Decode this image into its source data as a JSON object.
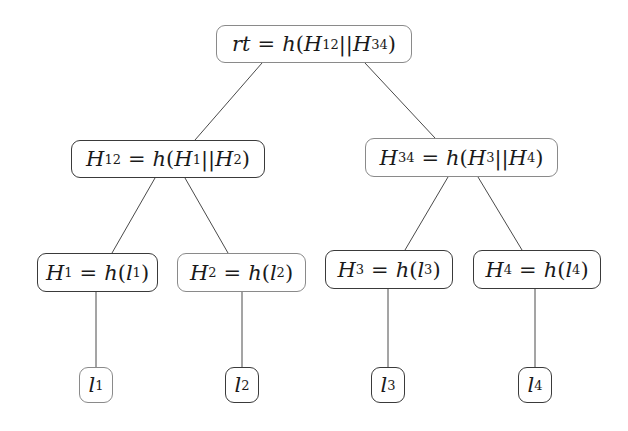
{
  "diagram": {
    "type": "merkle-tree",
    "nodes": [
      {
        "id": "root",
        "label": "rt = h(H12||H34)",
        "var": "rt",
        "fn": "h",
        "args": [
          "H12",
          "H34"
        ],
        "sep": "||"
      },
      {
        "id": "H12",
        "label": "H12 = h(H1||H2)",
        "var": "H",
        "var_sub": "12",
        "fn": "h",
        "args": [
          "H1",
          "H2"
        ],
        "sep": "||"
      },
      {
        "id": "H34",
        "label": "H34 = h(H3||H4)",
        "var": "H",
        "var_sub": "34",
        "fn": "h",
        "args": [
          "H3",
          "H4"
        ],
        "sep": "||"
      },
      {
        "id": "H1",
        "label": "H1 = h(l1)",
        "var": "H",
        "var_sub": "1",
        "fn": "h",
        "arg": "l",
        "arg_sub": "1"
      },
      {
        "id": "H2",
        "label": "H2 = h(l2)",
        "var": "H",
        "var_sub": "2",
        "fn": "h",
        "arg": "l",
        "arg_sub": "2"
      },
      {
        "id": "H3",
        "label": "H3 = h(l3)",
        "var": "H",
        "var_sub": "3",
        "fn": "h",
        "arg": "l",
        "arg_sub": "3"
      },
      {
        "id": "H4",
        "label": "H4 = h(l4)",
        "var": "H",
        "var_sub": "4",
        "fn": "h",
        "arg": "l",
        "arg_sub": "4"
      },
      {
        "id": "l1",
        "label": "l1",
        "var": "l",
        "var_sub": "1"
      },
      {
        "id": "l2",
        "label": "l2",
        "var": "l",
        "var_sub": "2"
      },
      {
        "id": "l3",
        "label": "l3",
        "var": "l",
        "var_sub": "3"
      },
      {
        "id": "l4",
        "label": "l4",
        "var": "l",
        "var_sub": "4"
      }
    ],
    "edges": [
      [
        "root",
        "H12"
      ],
      [
        "root",
        "H34"
      ],
      [
        "H12",
        "H1"
      ],
      [
        "H12",
        "H2"
      ],
      [
        "H34",
        "H3"
      ],
      [
        "H34",
        "H4"
      ],
      [
        "H1",
        "l1"
      ],
      [
        "H2",
        "l2"
      ],
      [
        "H3",
        "l3"
      ],
      [
        "H4",
        "l4"
      ]
    ],
    "text": {
      "eq": "=",
      "h": "h",
      "lp": "(",
      "rp": ")",
      "sep": "||",
      "rt": "rt",
      "H": "H",
      "l": "l",
      "s12": "12",
      "s34": "34",
      "s1": "1",
      "s2": "2",
      "s3": "3",
      "s4": "4"
    }
  }
}
